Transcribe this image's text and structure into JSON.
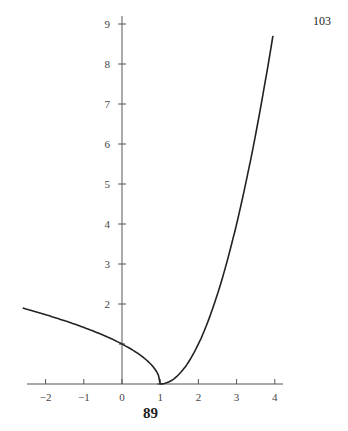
{
  "page_number": "103",
  "figure_label": "89",
  "chart_data": {
    "type": "line",
    "title": "",
    "xlabel": "",
    "ylabel": "",
    "xlim": [
      -2.5,
      4.2
    ],
    "ylim": [
      0,
      9.2
    ],
    "grid": false,
    "legend": null,
    "x_ticks": [
      -2,
      -1,
      0,
      1,
      2,
      3,
      4
    ],
    "x_tick_labels": [
      "−2",
      "−1",
      "0",
      "1",
      "2",
      "3",
      "4"
    ],
    "y_ticks": [
      2,
      3,
      4,
      5,
      6,
      7,
      8,
      9
    ],
    "y_tick_labels": [
      "2",
      "3",
      "4",
      "5",
      "6",
      "7",
      "8",
      "9"
    ],
    "series": [
      {
        "name": "left branch",
        "description": "approximately y = sqrt(1 - x) for x <= 1",
        "x": [
          -2.6,
          -2,
          -1.5,
          -1,
          -0.5,
          0,
          0.25,
          0.5,
          0.75,
          0.9,
          1
        ],
        "y": [
          1.9,
          1.73,
          1.58,
          1.41,
          1.22,
          1.0,
          0.87,
          0.71,
          0.5,
          0.32,
          0
        ]
      },
      {
        "name": "right branch",
        "description": "approximately y = (x - 1)^2 for x >= 1",
        "x": [
          1,
          1.25,
          1.5,
          1.75,
          2,
          2.5,
          3,
          3.5,
          3.95
        ],
        "y": [
          0,
          0.06,
          0.25,
          0.56,
          1.0,
          2.25,
          4.0,
          6.25,
          8.7
        ]
      }
    ],
    "marked_points": [
      {
        "x": 0,
        "y": 1
      },
      {
        "x": 1,
        "y": 0
      }
    ]
  }
}
